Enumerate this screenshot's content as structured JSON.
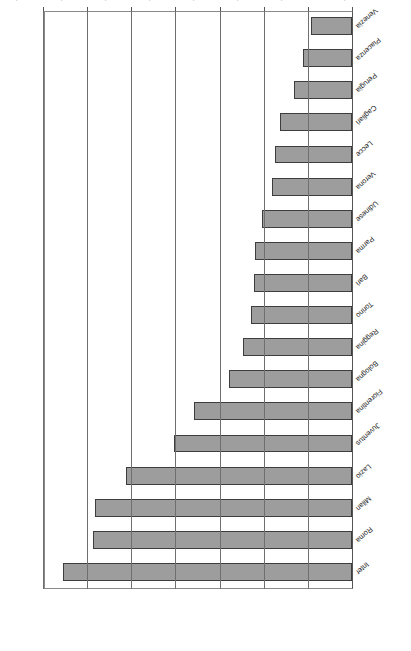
{
  "chart_data": {
    "type": "bar",
    "orientation": "horizontal",
    "title": "Italy",
    "xlabel": "",
    "ylabel": "Average home attendance",
    "value_axis_label": "Average home attendance",
    "categories": [
      "Inter",
      "Roma",
      "Milan",
      "Lazio",
      "Juventus",
      "Fiorentina",
      "Bologna",
      "Reggina",
      "Torino",
      "Bari",
      "Parma",
      "Udinese",
      "Verona",
      "Lecce",
      "Cagliari",
      "Perugia",
      "Piacenza",
      "Venezia"
    ],
    "values": [
      65500,
      58700,
      58200,
      51200,
      40400,
      35800,
      27800,
      24800,
      22800,
      22200,
      21900,
      20300,
      18200,
      17500,
      16400,
      13200,
      11100,
      9300
    ],
    "value_ticks": [
      0,
      10000,
      20000,
      30000,
      40000,
      50000,
      60000,
      70000
    ],
    "value_tick_labels": [
      "0",
      "10,000",
      "20,000",
      "30,000",
      "40,000",
      "50,000",
      "60,000",
      "70,000"
    ],
    "ylim": [
      0,
      70000
    ],
    "grid": "vertical",
    "legend": "none",
    "bar_color": "#9d9d9d",
    "bar_border_color": "#3d3d3d",
    "gridline_color": "#6f6f6f",
    "rotated_180": true
  }
}
